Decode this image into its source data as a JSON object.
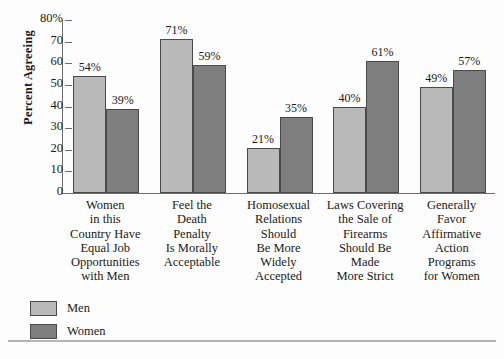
{
  "chart_data": {
    "type": "bar",
    "title": "",
    "xlabel": "",
    "ylabel": "Percent Agreeing",
    "ylim": [
      0,
      80
    ],
    "grid": false,
    "legend_position": "bottom-left",
    "categories": [
      "Women\nin this\nCountry Have\nEqual Job\nOpportunities\nwith Men",
      "Feel the\nDeath\nPenalty\nIs Morally\nAcceptable",
      "Homosexual\nRelations\nShould\nBe More\nWidely\nAccepted",
      "Laws Covering\nthe Sale of\nFirearms\nShould Be\nMade\nMore Strict",
      "Generally\nFavor\nAffirmative\nAction\nPrograms\nfor Women"
    ],
    "series": [
      {
        "name": "Men",
        "color": "#b9b9b9",
        "values": [
          54,
          71,
          21,
          40,
          49
        ],
        "labels": [
          "54%",
          "71%",
          "21%",
          "40%",
          "49%"
        ]
      },
      {
        "name": "Women",
        "color": "#7e7e7e",
        "values": [
          39,
          59,
          35,
          61,
          57
        ],
        "labels": [
          "39%",
          "59%",
          "35%",
          "61%",
          "57%"
        ]
      }
    ],
    "yticks": [
      {
        "value": 80,
        "label": "80%"
      },
      {
        "value": 70,
        "label": "70"
      },
      {
        "value": 60,
        "label": "60"
      },
      {
        "value": 50,
        "label": "50"
      },
      {
        "value": 40,
        "label": "40"
      },
      {
        "value": 30,
        "label": "30"
      },
      {
        "value": 20,
        "label": "20"
      },
      {
        "value": 10,
        "label": "10"
      },
      {
        "value": 0,
        "label": "0"
      }
    ]
  },
  "legend": {
    "entries": [
      {
        "label": "Men"
      },
      {
        "label": "Women"
      }
    ]
  },
  "colors": {
    "men_bar": "#b9b9b9",
    "women_bar": "#7e7e7e",
    "bar_outline": "#4a4a4a",
    "axis": "#6d6d6d",
    "background": "#fdfdfd",
    "rule": "#b4b4b4"
  }
}
